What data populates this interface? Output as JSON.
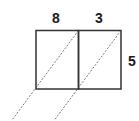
{
  "diagram": {
    "labels": {
      "left_width": "8",
      "right_width": "3",
      "height": "5"
    },
    "colors": {
      "stroke": "#333333",
      "dashed": "#555555",
      "text": "#1a1a1a"
    }
  }
}
